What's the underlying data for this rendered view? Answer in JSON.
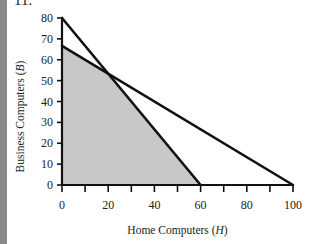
{
  "problem_number": "11.",
  "chart_data": {
    "type": "line",
    "title": "",
    "xlabel": "Home Computers (H)",
    "ylabel": "Business Computers (B)",
    "xlim": [
      0,
      100
    ],
    "ylim": [
      0,
      80
    ],
    "x_ticks": [
      0,
      20,
      40,
      60,
      80,
      100
    ],
    "y_ticks": [
      0,
      10,
      20,
      30,
      40,
      50,
      60,
      70,
      80
    ],
    "x_minor_ticks": [
      10,
      30,
      50,
      70,
      90
    ],
    "grid": false,
    "series": [
      {
        "name": "Constraint 1",
        "points": [
          [
            0,
            80
          ],
          [
            60,
            0
          ]
        ]
      },
      {
        "name": "Constraint 2",
        "points": [
          [
            0,
            66.7
          ],
          [
            100,
            0
          ]
        ]
      }
    ],
    "feasible_region": {
      "fill": "#c8c8c8",
      "vertices": [
        [
          0,
          0
        ],
        [
          0,
          66.7
        ],
        [
          20,
          53.3
        ],
        [
          60,
          0
        ]
      ]
    },
    "intersection": [
      20,
      53.3
    ]
  },
  "labels": {
    "xlabel_text": "Home Computers (",
    "xlabel_var": "H",
    "xlabel_close": ")",
    "ylabel_text": "Business Computers (",
    "ylabel_var": "B",
    "ylabel_close": ")"
  }
}
